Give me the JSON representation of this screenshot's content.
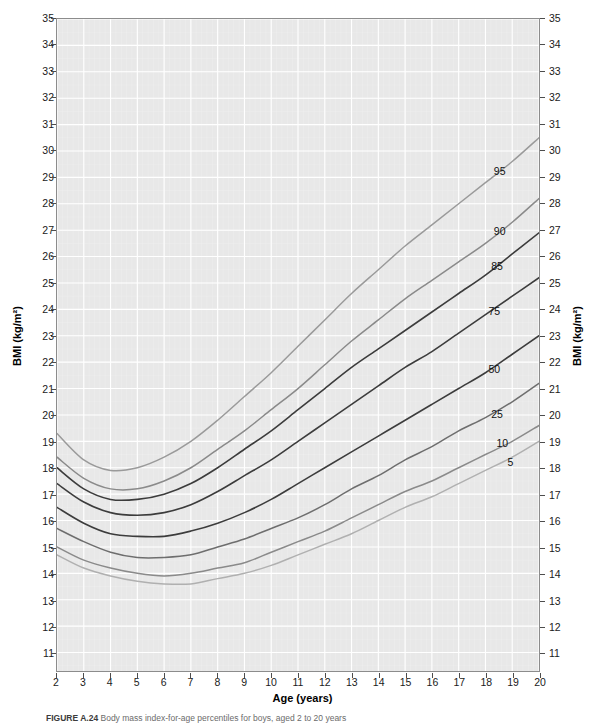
{
  "figure": {
    "caption_label": "FIGURE A.24",
    "caption_text": "Body mass index-for-age percentiles for boys, aged 2 to 20 years"
  },
  "axes": {
    "x": {
      "title": "Age (years)",
      "min": 2,
      "max": 20,
      "ticks": [
        2,
        3,
        4,
        5,
        6,
        7,
        8,
        9,
        10,
        11,
        12,
        13,
        14,
        15,
        16,
        17,
        18,
        19,
        20
      ],
      "tick_labels": [
        "2",
        "3",
        "4",
        "5",
        "6",
        "7",
        "8",
        "9",
        "10",
        "11",
        "12",
        "13",
        "14",
        "15",
        "16",
        "17",
        "18",
        "19",
        "20"
      ]
    },
    "y_left": {
      "title": "BMI (kg/m²)",
      "min": 10.3,
      "max": 35,
      "ticks": [
        11,
        12,
        13,
        14,
        15,
        16,
        17,
        18,
        19,
        20,
        21,
        22,
        23,
        24,
        25,
        26,
        27,
        28,
        29,
        30,
        31,
        32,
        33,
        34,
        35
      ],
      "tick_labels": [
        "11",
        "12",
        "13",
        "14",
        "15",
        "16",
        "17",
        "18",
        "19",
        "20",
        "21",
        "22",
        "23",
        "24",
        "25",
        "26",
        "27",
        "28",
        "29",
        "30",
        "31",
        "32",
        "33",
        "34",
        "35"
      ]
    },
    "y_right": {
      "title": "BMI (kg/m²)",
      "ticks": [
        11,
        12,
        13,
        14,
        15,
        16,
        17,
        18,
        19,
        20,
        21,
        22,
        23,
        24,
        25,
        26,
        27,
        28,
        29,
        30,
        31,
        32,
        33,
        34,
        35
      ],
      "tick_labels": [
        "11",
        "12",
        "13",
        "14",
        "15",
        "16",
        "17",
        "18",
        "19",
        "20",
        "21",
        "22",
        "23",
        "24",
        "25",
        "26",
        "27",
        "28",
        "29",
        "30",
        "31",
        "32",
        "33",
        "34",
        "35"
      ]
    }
  },
  "style": {
    "plot_background": "#e8e8e8",
    "gridline_color": "#ffffff",
    "axis_color": "#8c8c8c",
    "text_color": "#1a1a1a"
  },
  "chart_data": {
    "type": "line",
    "title": "Body mass index-for-age percentiles for boys, aged 2 to 20 years",
    "xlabel": "Age (years)",
    "ylabel": "BMI (kg/m²)",
    "xlim": [
      2,
      20
    ],
    "ylim": [
      10.3,
      35
    ],
    "grid": true,
    "legend_position": "inline-right-of-curves",
    "x": [
      2,
      3,
      4,
      5,
      6,
      7,
      8,
      9,
      10,
      11,
      12,
      13,
      14,
      15,
      16,
      17,
      18,
      19,
      20
    ],
    "series": [
      {
        "name": "95",
        "label": "95",
        "color": "#9a9a9a",
        "width": 1.5,
        "values": [
          19.3,
          18.3,
          17.9,
          18.0,
          18.4,
          19.0,
          19.8,
          20.7,
          21.6,
          22.6,
          23.6,
          24.6,
          25.5,
          26.4,
          27.2,
          28.0,
          28.8,
          29.6,
          30.5
        ]
      },
      {
        "name": "90",
        "label": "90",
        "color": "#8a8a8a",
        "width": 1.5,
        "values": [
          18.4,
          17.6,
          17.2,
          17.2,
          17.5,
          18.0,
          18.7,
          19.4,
          20.2,
          21.0,
          21.9,
          22.8,
          23.6,
          24.4,
          25.1,
          25.8,
          26.5,
          27.3,
          28.2
        ]
      },
      {
        "name": "85",
        "label": "85",
        "color": "#3c3c3c",
        "width": 1.6,
        "values": [
          18.0,
          17.2,
          16.8,
          16.8,
          17.0,
          17.4,
          18.0,
          18.7,
          19.4,
          20.2,
          21.0,
          21.8,
          22.5,
          23.2,
          23.9,
          24.6,
          25.3,
          26.1,
          26.9
        ]
      },
      {
        "name": "75",
        "label": "75",
        "color": "#3c3c3c",
        "width": 1.6,
        "values": [
          17.4,
          16.7,
          16.3,
          16.2,
          16.3,
          16.6,
          17.1,
          17.7,
          18.3,
          19.0,
          19.7,
          20.4,
          21.1,
          21.8,
          22.4,
          23.1,
          23.8,
          24.5,
          25.2
        ]
      },
      {
        "name": "50",
        "label": "50",
        "color": "#3c3c3c",
        "width": 1.6,
        "values": [
          16.5,
          15.9,
          15.5,
          15.4,
          15.4,
          15.6,
          15.9,
          16.3,
          16.8,
          17.4,
          18.0,
          18.6,
          19.2,
          19.8,
          20.4,
          21.0,
          21.6,
          22.3,
          23.0
        ]
      },
      {
        "name": "25",
        "label": "25",
        "color": "#6e6e6e",
        "width": 1.5,
        "values": [
          15.7,
          15.2,
          14.8,
          14.6,
          14.6,
          14.7,
          15.0,
          15.3,
          15.7,
          16.1,
          16.6,
          17.2,
          17.7,
          18.3,
          18.8,
          19.4,
          19.9,
          20.5,
          21.2
        ]
      },
      {
        "name": "10",
        "label": "10",
        "color": "#8a8a8a",
        "width": 1.5,
        "values": [
          15.0,
          14.5,
          14.2,
          14.0,
          13.9,
          14.0,
          14.2,
          14.4,
          14.8,
          15.2,
          15.6,
          16.1,
          16.6,
          17.1,
          17.5,
          18.0,
          18.5,
          19.0,
          19.6
        ]
      },
      {
        "name": "5",
        "label": "5",
        "color": "#b0b0b0",
        "width": 1.5,
        "values": [
          14.7,
          14.2,
          13.9,
          13.7,
          13.6,
          13.6,
          13.8,
          14.0,
          14.3,
          14.7,
          15.1,
          15.5,
          16.0,
          16.5,
          16.9,
          17.4,
          17.9,
          18.4,
          19.0
        ]
      }
    ],
    "curve_labels": [
      {
        "text": "95",
        "age": 18.5,
        "bmi": 29.2
      },
      {
        "text": "90",
        "age": 18.5,
        "bmi": 26.9
      },
      {
        "text": "85",
        "age": 18.4,
        "bmi": 25.6
      },
      {
        "text": "75",
        "age": 18.3,
        "bmi": 23.9
      },
      {
        "text": "50",
        "age": 18.3,
        "bmi": 21.7
      },
      {
        "text": "25",
        "age": 18.4,
        "bmi": 20.0
      },
      {
        "text": "10",
        "age": 18.6,
        "bmi": 18.9
      },
      {
        "text": "5",
        "age": 18.9,
        "bmi": 18.2
      }
    ]
  }
}
